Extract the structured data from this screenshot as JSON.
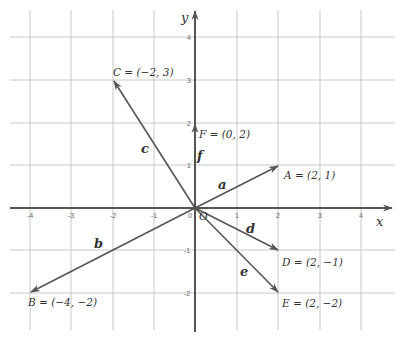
{
  "diagram": {
    "type": "coordinate-plane-vectors",
    "axes": {
      "x_label": "x",
      "y_label": "y",
      "x_ticks": [
        "-4",
        "-3",
        "-2",
        "-1",
        "0",
        "1",
        "2",
        "3",
        "4"
      ],
      "y_ticks": [
        "4",
        "3",
        "2",
        "1",
        "-1",
        "-2"
      ],
      "origin_label": "O",
      "zero_label": "0"
    },
    "vectors": [
      {
        "name": "a",
        "to": [
          2,
          1
        ],
        "point_label": "A = (2, 1)"
      },
      {
        "name": "b",
        "to": [
          -4,
          -2
        ],
        "point_label": "B = (−4, −2)"
      },
      {
        "name": "c",
        "to": [
          -2,
          3
        ],
        "point_label": "C = (−2, 3)"
      },
      {
        "name": "d",
        "to": [
          2,
          -1
        ],
        "point_label": "D = (2, −1)"
      },
      {
        "name": "e",
        "to": [
          2,
          -2
        ],
        "point_label": "E = (2, −2)"
      },
      {
        "name": "f",
        "to": [
          0,
          2
        ],
        "point_label": "F = (0, 2)"
      }
    ],
    "colors": {
      "axis": "#555555",
      "grid": "#c8c8c8",
      "vector": "#555555",
      "text": "#333333"
    }
  }
}
